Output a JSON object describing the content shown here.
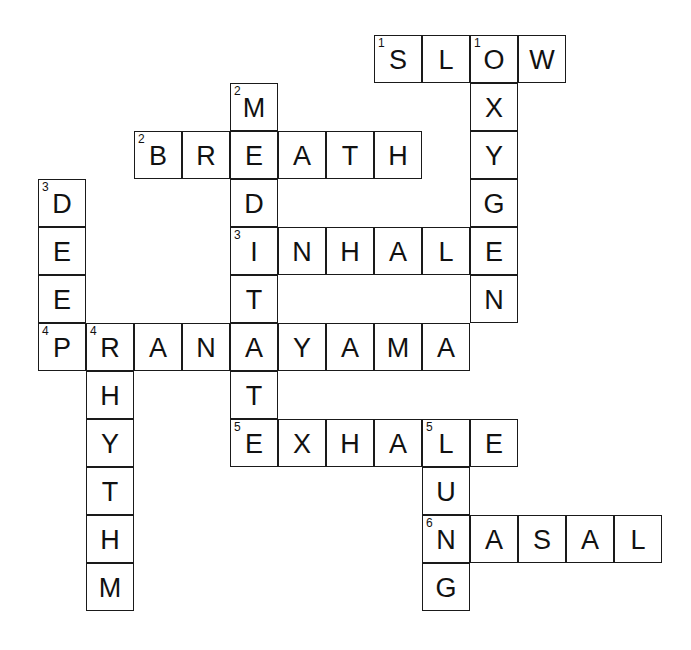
{
  "puzzle": {
    "title": "Breathing Crossword",
    "grid": {
      "origin_x": 38,
      "origin_y": 35,
      "cell_size": 48,
      "cols": 13,
      "rows": 12,
      "border_color": "#1a1a1a",
      "cell_color": "#ffffff",
      "text_color": "#111111"
    },
    "entries": [
      {
        "number": 1,
        "direction": "across",
        "answer": "SLOW",
        "row": 0,
        "col": 7
      },
      {
        "number": 1,
        "direction": "down",
        "answer": "OXYGEN",
        "row": 0,
        "col": 9
      },
      {
        "number": 2,
        "direction": "down",
        "answer": "MEDITATE",
        "row": 1,
        "col": 4
      },
      {
        "number": 2,
        "direction": "across",
        "answer": "BREATH",
        "row": 2,
        "col": 2
      },
      {
        "number": 3,
        "direction": "down",
        "answer": "DEEP",
        "row": 3,
        "col": 0
      },
      {
        "number": 3,
        "direction": "across",
        "answer": "INHALE",
        "row": 4,
        "col": 4
      },
      {
        "number": 4,
        "direction": "across",
        "answer": "PRANAYAMA",
        "row": 6,
        "col": 0
      },
      {
        "number": 4,
        "direction": "down",
        "answer": "RHYTHM",
        "row": 6,
        "col": 1
      },
      {
        "number": 5,
        "direction": "across",
        "answer": "EXHALE",
        "row": 8,
        "col": 4
      },
      {
        "number": 5,
        "direction": "down",
        "answer": "LUNG",
        "row": 8,
        "col": 8
      },
      {
        "number": 6,
        "direction": "across",
        "answer": "NASAL",
        "row": 10,
        "col": 8
      }
    ],
    "cells": [
      {
        "row": 0,
        "col": 7,
        "letter": "S",
        "number": "1"
      },
      {
        "row": 0,
        "col": 8,
        "letter": "L",
        "number": ""
      },
      {
        "row": 0,
        "col": 9,
        "letter": "O",
        "number": "1"
      },
      {
        "row": 0,
        "col": 10,
        "letter": "W",
        "number": ""
      },
      {
        "row": 1,
        "col": 4,
        "letter": "M",
        "number": "2"
      },
      {
        "row": 1,
        "col": 9,
        "letter": "X",
        "number": ""
      },
      {
        "row": 2,
        "col": 2,
        "letter": "B",
        "number": "2"
      },
      {
        "row": 2,
        "col": 3,
        "letter": "R",
        "number": ""
      },
      {
        "row": 2,
        "col": 4,
        "letter": "E",
        "number": ""
      },
      {
        "row": 2,
        "col": 5,
        "letter": "A",
        "number": ""
      },
      {
        "row": 2,
        "col": 6,
        "letter": "T",
        "number": ""
      },
      {
        "row": 2,
        "col": 7,
        "letter": "H",
        "number": ""
      },
      {
        "row": 2,
        "col": 9,
        "letter": "Y",
        "number": ""
      },
      {
        "row": 3,
        "col": 0,
        "letter": "D",
        "number": "3"
      },
      {
        "row": 3,
        "col": 4,
        "letter": "D",
        "number": ""
      },
      {
        "row": 3,
        "col": 9,
        "letter": "G",
        "number": ""
      },
      {
        "row": 4,
        "col": 0,
        "letter": "E",
        "number": ""
      },
      {
        "row": 4,
        "col": 4,
        "letter": "I",
        "number": "3"
      },
      {
        "row": 4,
        "col": 5,
        "letter": "N",
        "number": ""
      },
      {
        "row": 4,
        "col": 6,
        "letter": "H",
        "number": ""
      },
      {
        "row": 4,
        "col": 7,
        "letter": "A",
        "number": ""
      },
      {
        "row": 4,
        "col": 8,
        "letter": "L",
        "number": ""
      },
      {
        "row": 4,
        "col": 9,
        "letter": "E",
        "number": ""
      },
      {
        "row": 5,
        "col": 0,
        "letter": "E",
        "number": ""
      },
      {
        "row": 5,
        "col": 4,
        "letter": "T",
        "number": ""
      },
      {
        "row": 5,
        "col": 9,
        "letter": "N",
        "number": ""
      },
      {
        "row": 6,
        "col": 0,
        "letter": "P",
        "number": "4"
      },
      {
        "row": 6,
        "col": 1,
        "letter": "R",
        "number": "4"
      },
      {
        "row": 6,
        "col": 2,
        "letter": "A",
        "number": ""
      },
      {
        "row": 6,
        "col": 3,
        "letter": "N",
        "number": ""
      },
      {
        "row": 6,
        "col": 4,
        "letter": "A",
        "number": ""
      },
      {
        "row": 6,
        "col": 5,
        "letter": "Y",
        "number": ""
      },
      {
        "row": 6,
        "col": 6,
        "letter": "A",
        "number": ""
      },
      {
        "row": 6,
        "col": 7,
        "letter": "M",
        "number": ""
      },
      {
        "row": 6,
        "col": 8,
        "letter": "A",
        "number": ""
      },
      {
        "row": 7,
        "col": 1,
        "letter": "H",
        "number": ""
      },
      {
        "row": 7,
        "col": 4,
        "letter": "T",
        "number": ""
      },
      {
        "row": 8,
        "col": 1,
        "letter": "Y",
        "number": ""
      },
      {
        "row": 8,
        "col": 4,
        "letter": "E",
        "number": "5"
      },
      {
        "row": 8,
        "col": 5,
        "letter": "X",
        "number": ""
      },
      {
        "row": 8,
        "col": 6,
        "letter": "H",
        "number": ""
      },
      {
        "row": 8,
        "col": 7,
        "letter": "A",
        "number": ""
      },
      {
        "row": 8,
        "col": 8,
        "letter": "L",
        "number": "5"
      },
      {
        "row": 8,
        "col": 9,
        "letter": "E",
        "number": ""
      },
      {
        "row": 9,
        "col": 1,
        "letter": "T",
        "number": ""
      },
      {
        "row": 9,
        "col": 8,
        "letter": "U",
        "number": ""
      },
      {
        "row": 10,
        "col": 1,
        "letter": "H",
        "number": ""
      },
      {
        "row": 10,
        "col": 8,
        "letter": "N",
        "number": "6"
      },
      {
        "row": 10,
        "col": 9,
        "letter": "A",
        "number": ""
      },
      {
        "row": 10,
        "col": 10,
        "letter": "S",
        "number": ""
      },
      {
        "row": 10,
        "col": 11,
        "letter": "A",
        "number": ""
      },
      {
        "row": 10,
        "col": 12,
        "letter": "L",
        "number": ""
      },
      {
        "row": 11,
        "col": 1,
        "letter": "M",
        "number": ""
      },
      {
        "row": 11,
        "col": 8,
        "letter": "G",
        "number": ""
      }
    ]
  }
}
